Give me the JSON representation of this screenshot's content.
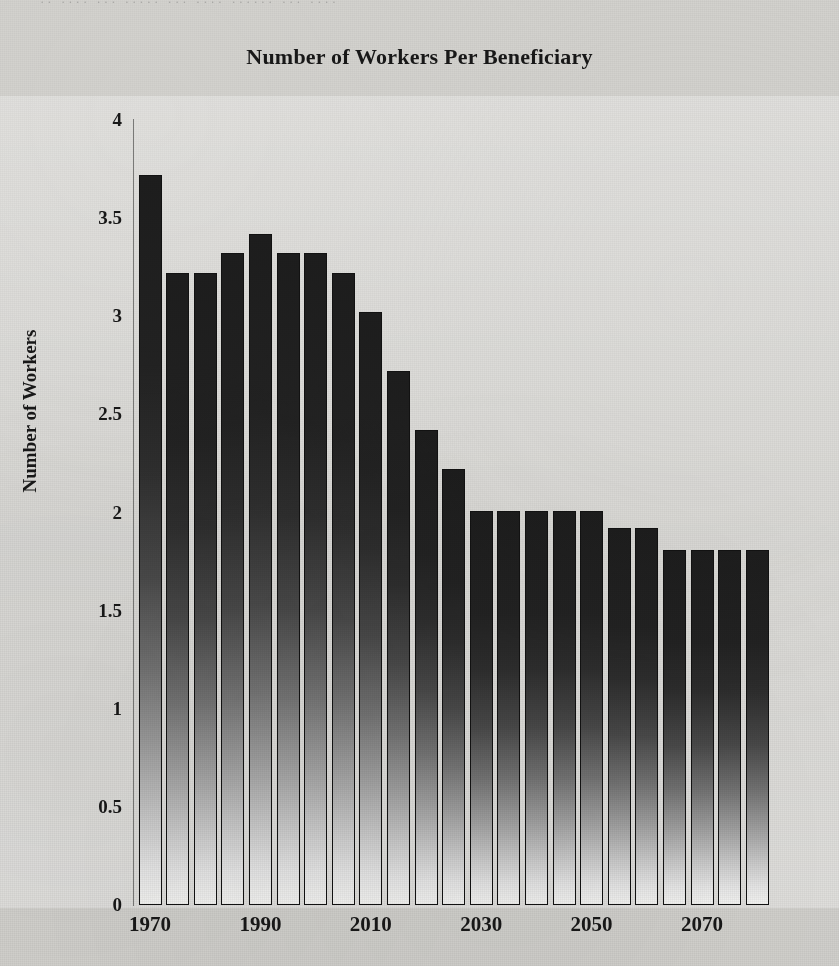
{
  "page": {
    "bleed_text": "·· ···· ··· ····· ··· ···· ······ ··· ····",
    "background_color": "#d3d2ce",
    "ink_color": "#181818"
  },
  "chart_data": {
    "type": "bar",
    "title": "Number of Workers Per Beneficiary",
    "xlabel": "",
    "ylabel": "Number of Workers",
    "ylim": [
      0,
      4
    ],
    "y_ticks": [
      "0",
      "0.5",
      "1",
      "1.5",
      "2",
      "2.5",
      "3",
      "3.5",
      "4"
    ],
    "y_tick_values": [
      0,
      0.5,
      1,
      1.5,
      2,
      2.5,
      3,
      3.5,
      4
    ],
    "x_tick_labels": [
      "1970",
      "1990",
      "2010",
      "2030",
      "2050",
      "2070"
    ],
    "x_tick_values": [
      1970,
      1990,
      2010,
      2030,
      2050,
      2070
    ],
    "grid": false,
    "legend": null,
    "bar_color_top": "#1d1d1d",
    "bar_color_bottom": "#f6f6f4",
    "categories": [
      "1970",
      "1975",
      "1980",
      "1985",
      "1990",
      "1995",
      "2000",
      "2005",
      "2010",
      "2015",
      "2020",
      "2025",
      "2030",
      "2035",
      "2040",
      "2045",
      "2050",
      "2055",
      "2060",
      "2065",
      "2070",
      "2075",
      "2080"
    ],
    "values": [
      3.72,
      3.22,
      3.22,
      3.32,
      3.42,
      3.32,
      3.32,
      3.22,
      3.02,
      2.72,
      2.42,
      2.22,
      2.01,
      2.01,
      2.01,
      2.01,
      2.01,
      1.92,
      1.92,
      1.81,
      1.81,
      1.81,
      1.81
    ],
    "series": [
      {
        "name": "Number of Workers Per Beneficiary",
        "values": [
          3.72,
          3.22,
          3.22,
          3.32,
          3.42,
          3.32,
          3.32,
          3.22,
          3.02,
          2.72,
          2.42,
          2.22,
          2.01,
          2.01,
          2.01,
          2.01,
          2.01,
          1.92,
          1.92,
          1.81,
          1.81,
          1.81,
          1.81
        ]
      }
    ]
  }
}
